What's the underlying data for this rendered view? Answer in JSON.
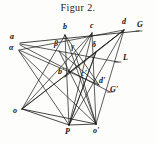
{
  "figure": {
    "title": "Figur 2.",
    "caption_position": "top-center",
    "ink_color": "#171717",
    "paper_color": "#fdfdfb",
    "type": "geometric-line-diagram",
    "labels": [
      {
        "id": "a",
        "text": "a",
        "x": 10,
        "y": 37,
        "style": "italic"
      },
      {
        "id": "alpha",
        "text": "α",
        "x": 9,
        "y": 47,
        "style": "greek"
      },
      {
        "id": "b",
        "text": "b",
        "x": 63,
        "y": 27,
        "style": "italic"
      },
      {
        "id": "c",
        "text": "c",
        "x": 90,
        "y": 26,
        "style": "italic"
      },
      {
        "id": "d",
        "text": "d",
        "x": 122,
        "y": 22,
        "style": "italic"
      },
      {
        "id": "G",
        "text": "G",
        "x": 138,
        "y": 25,
        "style": "upright"
      },
      {
        "id": "beta",
        "text": "β",
        "x": 55,
        "y": 44,
        "style": "greek"
      },
      {
        "id": "gamma",
        "text": "γ",
        "x": 72,
        "y": 47,
        "style": "greek"
      },
      {
        "id": "delta",
        "text": "δ",
        "x": 93,
        "y": 45,
        "style": "greek"
      },
      {
        "id": "L",
        "text": "L",
        "x": 121,
        "y": 57,
        "style": "upright"
      },
      {
        "id": "b-prime",
        "text": "b'",
        "x": 59,
        "y": 71,
        "style": "italic"
      },
      {
        "id": "c-prime",
        "text": "c'",
        "x": 82,
        "y": 73,
        "style": "italic"
      },
      {
        "id": "d-prime",
        "text": "d'",
        "x": 100,
        "y": 80,
        "style": "italic"
      },
      {
        "id": "G-prime",
        "text": "G'",
        "x": 111,
        "y": 89,
        "style": "upright"
      },
      {
        "id": "o",
        "text": "o",
        "x": 13,
        "y": 111,
        "style": "italic"
      },
      {
        "id": "P",
        "text": "P",
        "x": 66,
        "y": 131,
        "style": "upright"
      },
      {
        "id": "o-prime",
        "text": "o'",
        "x": 94,
        "y": 130,
        "style": "italic"
      }
    ],
    "points": {
      "a": [
        20,
        43
      ],
      "alpha": [
        19,
        50
      ],
      "b": [
        65,
        35
      ],
      "c": [
        92,
        33
      ],
      "d": [
        124,
        30
      ],
      "G": [
        139,
        31
      ],
      "beta": [
        59,
        51
      ],
      "gamma": [
        75,
        53
      ],
      "delta": [
        96,
        52
      ],
      "L": [
        118,
        62
      ],
      "bprime": [
        65,
        77
      ],
      "cprime": [
        88,
        77
      ],
      "dprime": [
        99,
        85
      ],
      "Gprime": [
        110,
        92
      ],
      "o": [
        22,
        109
      ],
      "P": [
        69,
        125
      ],
      "oprime": [
        96,
        124
      ]
    },
    "segments": [
      {
        "name": "upper-ray-a-to-G",
        "from": "a",
        "to": "G"
      },
      {
        "name": "line-a-to-L",
        "from": "a",
        "to": "L"
      },
      {
        "name": "line-a-to-Gprime",
        "from": "a",
        "to": "Gprime"
      },
      {
        "name": "line-alpha-to-d",
        "from": "alpha",
        "to": "d"
      },
      {
        "name": "line-alpha-to-cprime",
        "from": "alpha",
        "to": "cprime"
      },
      {
        "name": "line-alpha-to-oprime",
        "from": "alpha",
        "to": "oprime"
      },
      {
        "name": "line-alpha-to-P",
        "from": "alpha",
        "to": "P"
      },
      {
        "name": "line-o-to-b",
        "from": "o",
        "to": "b"
      },
      {
        "name": "line-o-to-c",
        "from": "o",
        "to": "c"
      },
      {
        "name": "line-o-to-d",
        "from": "o",
        "to": "d"
      },
      {
        "name": "line-o-to-oprime",
        "from": "o",
        "to": "oprime"
      },
      {
        "name": "line-oprime-to-b",
        "from": "oprime",
        "to": "b"
      },
      {
        "name": "line-oprime-to-beta",
        "from": "oprime",
        "to": "beta"
      },
      {
        "name": "line-oprime-to-c",
        "from": "oprime",
        "to": "c"
      },
      {
        "name": "line-oprime-to-d",
        "from": "oprime",
        "to": "d"
      },
      {
        "name": "line-P-to-b",
        "from": "P",
        "to": "b"
      },
      {
        "name": "line-P-to-c",
        "from": "P",
        "to": "c"
      },
      {
        "name": "line-P-to-d",
        "from": "P",
        "to": "d"
      },
      {
        "name": "vertical-b-bprime-P",
        "from": "b",
        "to": "P"
      },
      {
        "name": "vertical-c-cprime-oprime",
        "from": "c",
        "to": "oprime"
      }
    ]
  }
}
